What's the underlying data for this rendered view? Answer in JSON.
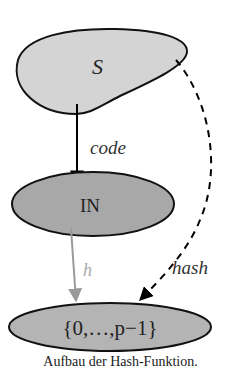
{
  "diagram": {
    "nodes": {
      "S": {
        "label": "S",
        "fill": "#d4d4d4"
      },
      "N": {
        "label": "IN",
        "fill": "#a8a8a8"
      },
      "range": {
        "label": "{0,…,p−1}",
        "fill": "#b4b4b4"
      }
    },
    "edges": {
      "code": {
        "label": "code",
        "color": "#000000",
        "style": "solid"
      },
      "h": {
        "label": "h",
        "color": "#9a9a9a",
        "style": "solid"
      },
      "hash": {
        "label": "hash",
        "color": "#000000",
        "style": "dashed"
      }
    },
    "caption": "Aufbau der Hash-Funktion."
  }
}
